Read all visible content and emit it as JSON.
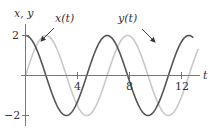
{
  "chart_data": {
    "type": "line",
    "title": "",
    "xlabel": "t",
    "ylabel": "x, y",
    "xlim": [
      0,
      13.8
    ],
    "ylim": [
      -2.5,
      2.5
    ],
    "x_ticks": [
      4,
      8,
      12
    ],
    "x_tick_labels": [
      "4",
      "8",
      "12"
    ],
    "y_ticks": [
      2,
      -2
    ],
    "y_tick_labels": [
      "2",
      "−2"
    ],
    "grid": false,
    "legend": "none (inline annotations with arrows)",
    "series": [
      {
        "name": "x(t)",
        "formula": "2 cos t",
        "color": "#555555",
        "t_range": [
          0,
          12.9
        ],
        "x": [
          0,
          1.571,
          3.142,
          4.712,
          6.283,
          7.854,
          9.425,
          10.996,
          12.566
        ],
        "values": [
          2,
          0,
          -2,
          0,
          2,
          0,
          -2,
          0,
          2
        ]
      },
      {
        "name": "y(t)",
        "formula": "2 sin t",
        "color": "#c8c8c8",
        "t_range": [
          0,
          13.3
        ],
        "x": [
          0,
          1.571,
          3.142,
          4.712,
          6.283,
          7.854,
          9.425,
          10.996,
          12.566
        ],
        "values": [
          0,
          2,
          0,
          -2,
          0,
          2,
          0,
          -2,
          0
        ]
      }
    ],
    "annotations": [
      {
        "text": "x(t)",
        "points_to": "x(t) curve near t≈1"
      },
      {
        "text": "y(t)",
        "points_to": "y(t) curve near t≈10"
      }
    ]
  },
  "labels": {
    "axis_y": "x, y",
    "axis_x": "t",
    "tick_2": "2",
    "tick_neg2": "−2",
    "tick_4": "4",
    "tick_8": "8",
    "tick_12": "12",
    "ann_x": "x(t)",
    "ann_y": "y(t)"
  },
  "colors": {
    "x_curve": "#555555",
    "y_curve": "#c8c8c8",
    "axis": "#777777"
  }
}
